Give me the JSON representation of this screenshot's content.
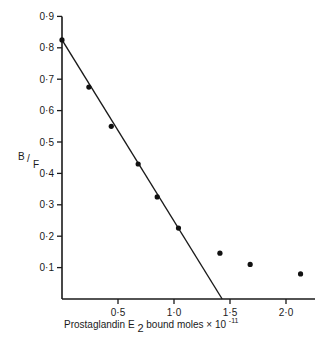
{
  "chart_data": {
    "type": "scatter",
    "title": "",
    "xlabel": "Prostaglandin E2 bound moles × 10^-11",
    "xlabel_parts": {
      "main": "Prostaglandin E",
      "subscript": "2",
      "rest": " bound moles × 10",
      "superscript": "-11"
    },
    "ylabel": "B/F",
    "ylabel_parts": {
      "num": "B",
      "den": "F"
    },
    "xlim": [
      0,
      2.3
    ],
    "ylim": [
      0,
      0.9
    ],
    "x_ticks": [
      {
        "value": 0.5,
        "label": "0·5"
      },
      {
        "value": 1.0,
        "label": "1·0"
      },
      {
        "value": 1.5,
        "label": "1·5"
      },
      {
        "value": 2.0,
        "label": "2·0"
      }
    ],
    "y_ticks": [
      {
        "value": 0.1,
        "label": "0·1"
      },
      {
        "value": 0.2,
        "label": "0·2"
      },
      {
        "value": 0.3,
        "label": "0·3"
      },
      {
        "value": 0.4,
        "label": "0·4"
      },
      {
        "value": 0.5,
        "label": "0·5"
      },
      {
        "value": 0.6,
        "label": "0·6"
      },
      {
        "value": 0.7,
        "label": "0·7"
      },
      {
        "value": 0.8,
        "label": "0·8"
      },
      {
        "value": 0.9,
        "label": "0·9"
      }
    ],
    "grid": false,
    "legend": null,
    "series": [
      {
        "name": "data points",
        "type": "scatter",
        "x": [
          0.0,
          0.24,
          0.44,
          0.68,
          0.85,
          1.04,
          1.41,
          1.68,
          2.13
        ],
        "y": [
          0.825,
          0.675,
          0.55,
          0.43,
          0.325,
          0.226,
          0.146,
          0.11,
          0.08
        ]
      },
      {
        "name": "fitted line",
        "type": "line",
        "x": [
          0.0,
          1.43
        ],
        "y": [
          0.825,
          0.0
        ]
      }
    ]
  }
}
